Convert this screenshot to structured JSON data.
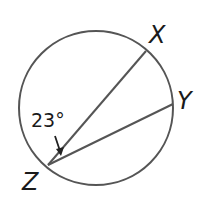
{
  "diagram": {
    "type": "circle-inscribed-angle",
    "points": {
      "X": "X",
      "Y": "Y",
      "Z": "Z"
    },
    "angle_label": "23°",
    "angle_vertex": "Z",
    "chords": [
      "ZX",
      "ZY"
    ],
    "colors": {
      "stroke": "#555555",
      "text": "#1a1a1a",
      "background": "#ffffff"
    }
  }
}
